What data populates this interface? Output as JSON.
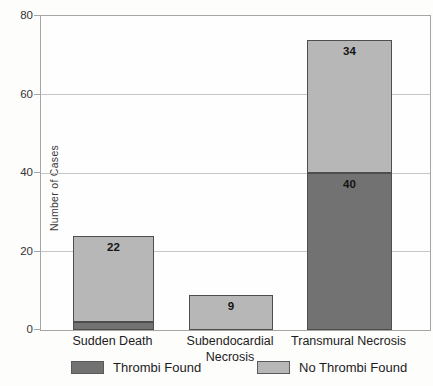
{
  "chart_data": {
    "type": "bar",
    "stacked": true,
    "title": "",
    "ylabel": "Number of Cases",
    "xlabel": "",
    "ylim": [
      0,
      80
    ],
    "yticks": [
      0,
      20,
      40,
      60,
      80
    ],
    "grid": true,
    "legend_position": "bottom",
    "categories": [
      "Sudden Death",
      "Subendocardial Necrosis",
      "Transmural Necrosis"
    ],
    "series": [
      {
        "name": "Thrombi Found",
        "color": "#727272",
        "values": [
          2,
          0,
          40
        ]
      },
      {
        "name": "No Thrombi Found",
        "color": "#b7b7b7",
        "values": [
          22,
          9,
          34
        ]
      }
    ],
    "colors": {
      "bar_border": "#4e4e4e",
      "gridline": "#c6c6c6",
      "frame": "#a6a6a6",
      "text": "#1c1c1c",
      "value_label": "#141414"
    }
  }
}
